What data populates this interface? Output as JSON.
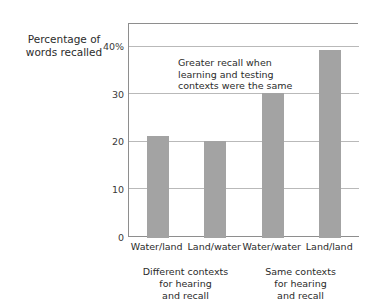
{
  "chart_data": {
    "type": "bar",
    "title": "",
    "subtitle": "",
    "xlabel": "",
    "ylabel": "Percentage of words recalled",
    "ylim": [
      0,
      45
    ],
    "grid": true,
    "legend": "none",
    "categories": [
      "Water/land",
      "Land/water",
      "Water/water",
      "Land/land"
    ],
    "values": [
      21.5,
      20.5,
      30.5,
      39.5
    ],
    "ytick_labels": [
      "0",
      "10",
      "20",
      "30",
      "40%"
    ],
    "ytick_values": [
      0,
      10,
      20,
      30,
      40
    ],
    "bar_color": "#a3a3a3",
    "annotations": [
      {
        "name": "greater-recall-note",
        "lines": [
          "Greater recall when",
          "learning and testing",
          "contexts were the same"
        ]
      }
    ],
    "group_labels": [
      {
        "lines": [
          "Different contexts",
          "for hearing",
          "and recall"
        ]
      },
      {
        "lines": [
          "Same contexts",
          "for hearing",
          "and recall"
        ]
      }
    ]
  },
  "axis": {
    "y_title_lines": [
      "Percentage of",
      "words recalled"
    ],
    "line_color": "#8e8e8e",
    "grid_color": "#b9b9b9"
  }
}
